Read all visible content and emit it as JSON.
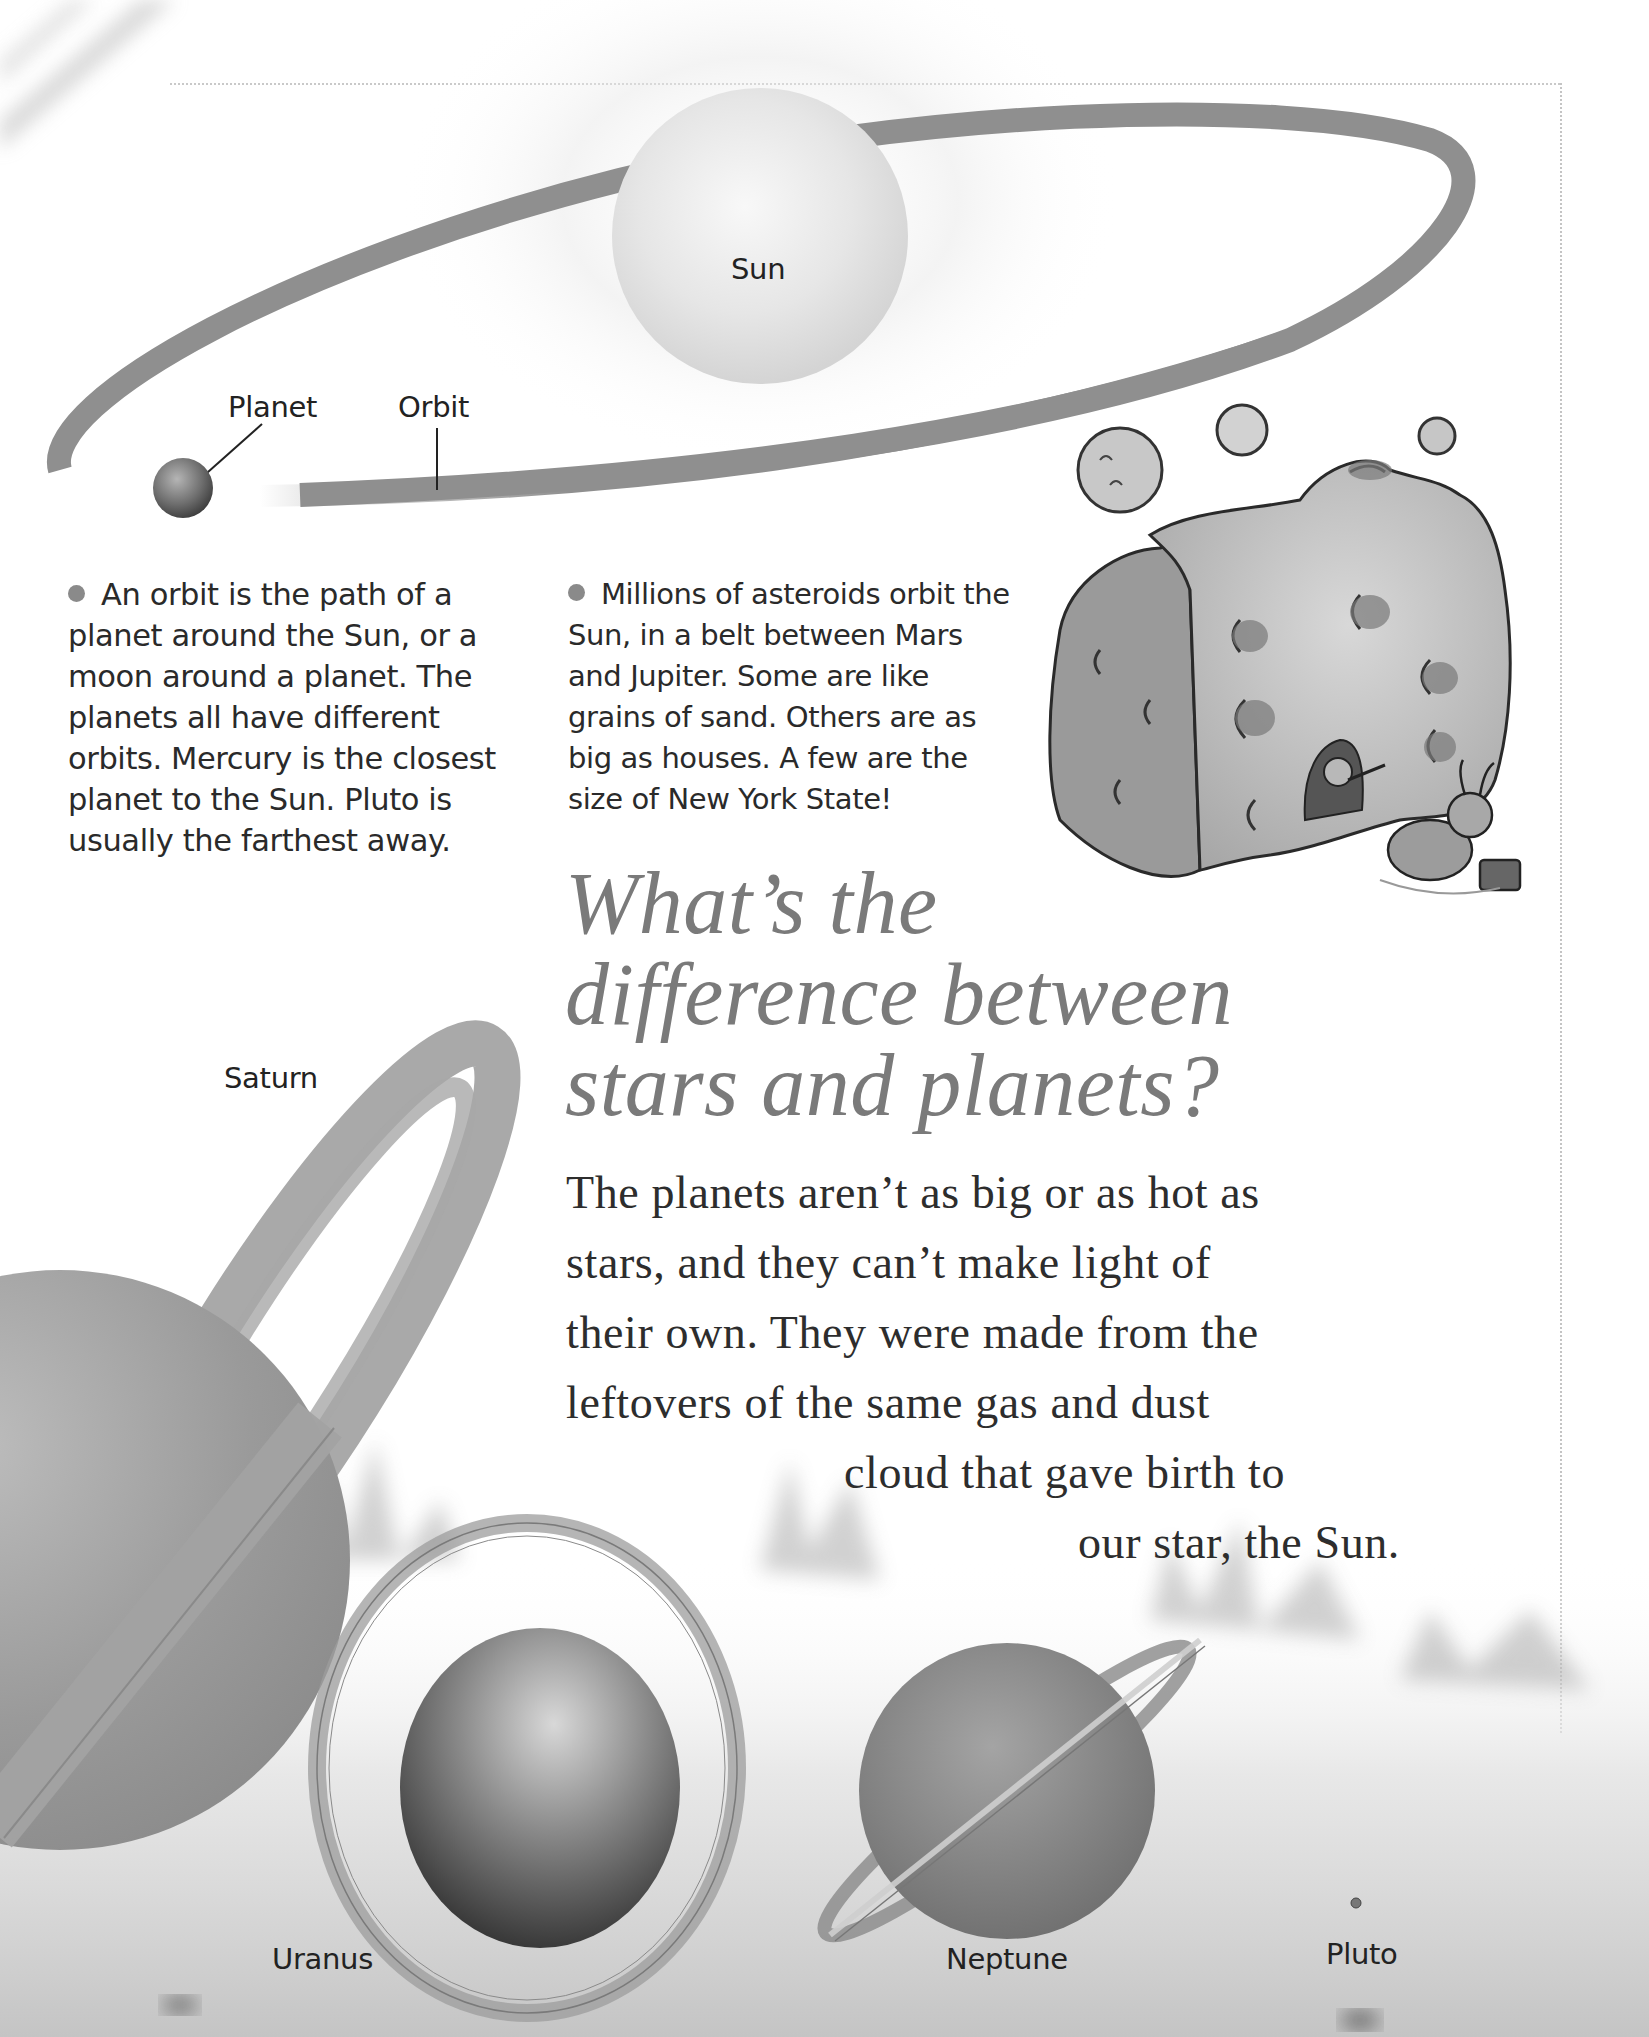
{
  "diagram": {
    "sun_label": "Sun",
    "planet_label": "Planet",
    "orbit_label": "Orbit"
  },
  "facts": [
    {
      "bullet_icon": "bullet-dot",
      "lines": [
        "An orbit is the path of a",
        "planet around the Sun, or a",
        "moon around a planet. The",
        "planets all have different",
        "orbits. Mercury is the closest",
        "planet to the Sun. Pluto is",
        "usually the farthest away."
      ]
    },
    {
      "bullet_icon": "bullet-dot",
      "lines": [
        "Millions of asteroids orbit the",
        "Sun, in a belt between Mars",
        "and Jupiter. Some are like",
        "grains of sand. Others are as",
        "big as houses. A few are the",
        "size of New York State!"
      ]
    }
  ],
  "headline": {
    "lines": [
      "What’s the",
      "difference between",
      "stars and planets?"
    ],
    "color": "#7a7a7a"
  },
  "answer": {
    "lines": [
      "The planets aren’t as big or as hot as",
      "stars, and they can’t make light of",
      "their own. They were made from the",
      "leftovers of the same gas and dust",
      "cloud that gave birth to",
      "our star, the Sun."
    ]
  },
  "planets": {
    "saturn": "Saturn",
    "uranus": "Uranus",
    "neptune": "Neptune",
    "pluto": "Pluto"
  },
  "colors": {
    "orbit_band": "#8f8f8f",
    "text": "#2a2a2a",
    "bullet": "#8a8a8a",
    "ground": "#c8c8c8"
  }
}
